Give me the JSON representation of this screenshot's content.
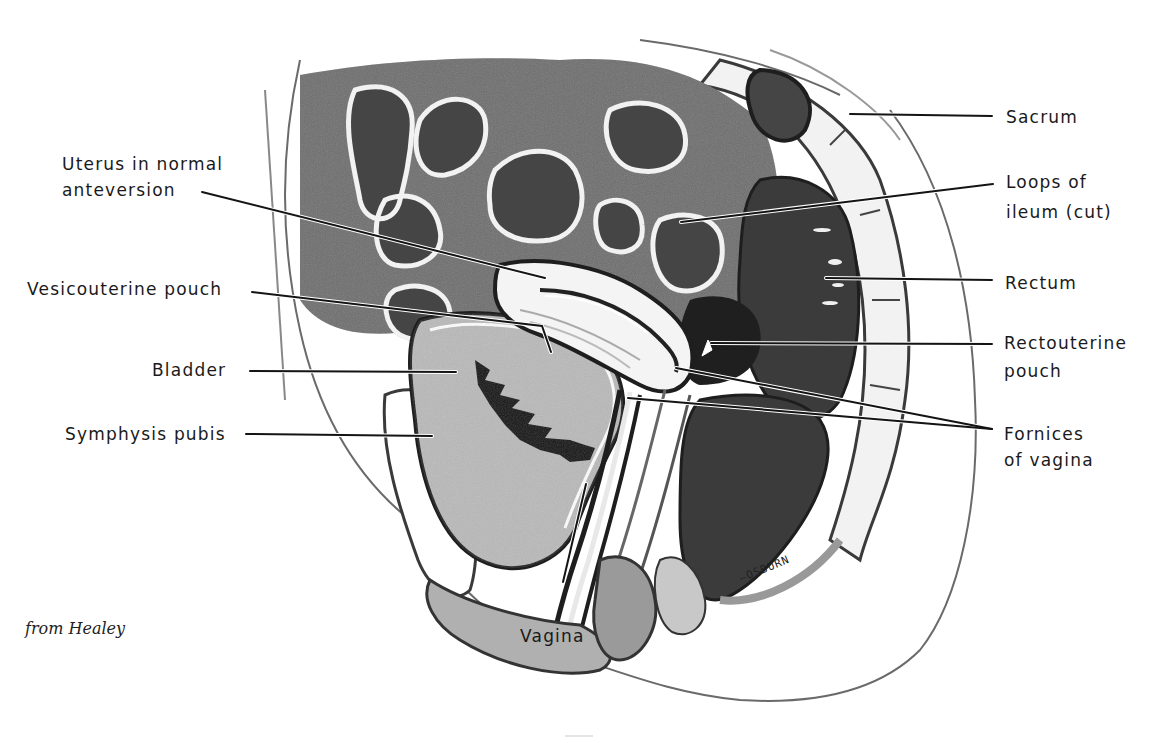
{
  "figure": {
    "credit": "from Healey",
    "artist_signature": "–OSBURN",
    "caption_partial": "Fi..."
  },
  "labels": {
    "left": [
      {
        "id": "uterus",
        "lines": [
          "Uterus in normal",
          "anteversion"
        ]
      },
      {
        "id": "vesicouterine_pouch",
        "lines": [
          "Vesicouterine pouch"
        ]
      },
      {
        "id": "bladder",
        "lines": [
          "Bladder"
        ]
      },
      {
        "id": "symphysis_pubis",
        "lines": [
          "Symphysis pubis"
        ]
      }
    ],
    "right": [
      {
        "id": "sacrum",
        "lines": [
          "Sacrum"
        ]
      },
      {
        "id": "loops_of_ileum",
        "lines": [
          "Loops of",
          "ileum (cut)"
        ]
      },
      {
        "id": "rectum",
        "lines": [
          "Rectum"
        ]
      },
      {
        "id": "rectouterine_pouch",
        "lines": [
          "Rectouterine",
          "pouch"
        ]
      },
      {
        "id": "fornices_of_vagina",
        "lines": [
          "Fornices",
          "of vagina"
        ]
      }
    ],
    "bottom": [
      {
        "id": "vagina",
        "lines": [
          "Vagina"
        ]
      }
    ]
  },
  "colors": {
    "ink": "#1a1a1a",
    "dark_tissue": "#3a3a3a",
    "mid_tissue": "#8a8a8a",
    "light_tissue": "#d6d6d6",
    "background": "#ffffff"
  }
}
